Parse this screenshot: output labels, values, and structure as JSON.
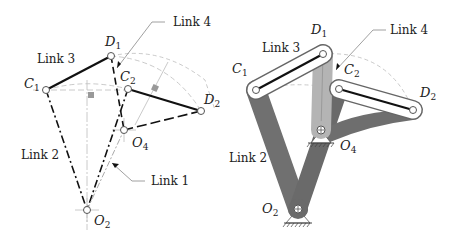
{
  "figure": {
    "left_panel": {
      "description": "Kinematic skeleton of four-bar linkage, two positions",
      "labels": {
        "link1": "Link 1",
        "link2": "Link 2",
        "link3": "Link 3",
        "link4": "Link 4",
        "C1": "C",
        "C1_sub": "1",
        "D1": "D",
        "D1_sub": "1",
        "C2": "C",
        "C2_sub": "2",
        "D2": "D",
        "D2_sub": "2",
        "O2": "O",
        "O2_sub": "2",
        "O4": "O",
        "O4_sub": "4"
      }
    },
    "right_panel": {
      "description": "Shaded physical linkage rendering, two positions",
      "labels": {
        "link2": "Link 2",
        "link3": "Link 3",
        "link4": "Link 4",
        "C1": "C",
        "C1_sub": "1",
        "D1": "D",
        "D1_sub": "1",
        "C2": "C",
        "C2_sub": "2",
        "D2": "D",
        "D2_sub": "2",
        "O2": "O",
        "O2_sub": "2",
        "O4": "O",
        "O4_sub": "4"
      }
    },
    "colors": {
      "line": "#222222",
      "construction": "#b0b0b0",
      "dark_link": "#707070",
      "light_link": "#b4b4b4",
      "right_angle_mark": "#999999"
    }
  }
}
